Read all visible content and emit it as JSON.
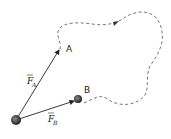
{
  "diagram": {
    "points": {
      "origin": {
        "x": 16,
        "y": 120
      },
      "A": {
        "label": "A",
        "x": 60,
        "y": 49
      },
      "B": {
        "label": "B",
        "x": 78,
        "y": 99
      }
    },
    "vectors": [
      {
        "name": "F_A",
        "symbol": "F",
        "subscript": "A"
      },
      {
        "name": "F_B",
        "symbol": "F",
        "subscript": "B"
      }
    ],
    "path": {
      "style": "dashed",
      "from": "B",
      "to": "A"
    },
    "colors": {
      "line": "#222222",
      "dash": "#666666",
      "particle": "#333333"
    }
  }
}
